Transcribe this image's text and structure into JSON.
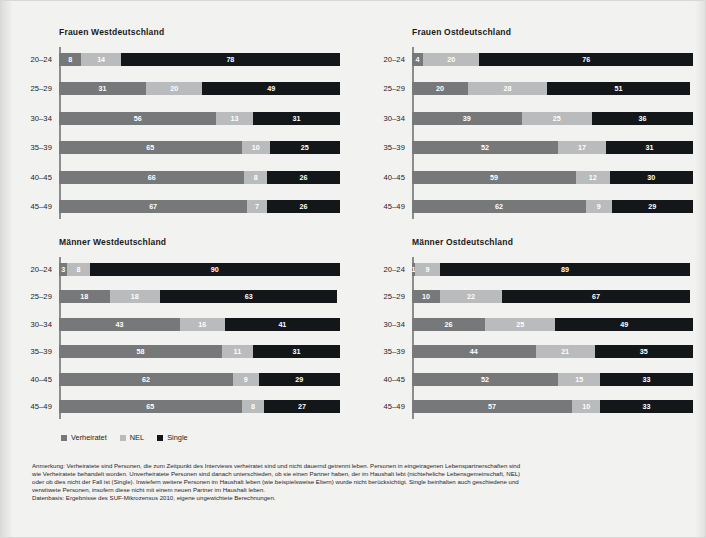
{
  "legend": {
    "items": [
      {
        "label": "Verheiratet",
        "key": "verheiratet",
        "color": "#76787a"
      },
      {
        "label": "NEL",
        "key": "nel",
        "color": "#b9bbbc"
      },
      {
        "label": "Single",
        "key": "single",
        "color": "#14171a"
      }
    ]
  },
  "notes": {
    "line1": "Anmerkung: Verheiratete sind Personen, die zum Zeitpunkt des Interviews verheiratet sind und nicht dauernd getrennt leben. Personen in eingetragenen Lebenspartnerschaften sind",
    "line2": "wie Verheiratete behandelt worden. Unverheiratete Personen sind danach unterschieden, ob sie einen Partner haben, der im Haushalt lebt (nichteheliche Lebensgemeinschaft, NEL)",
    "line3": "oder ob dies nicht der Fall ist (Single). Inwiefern weitere Personen im Haushalt leben (wie beispielsweise Eltern) wurde nicht berücksichtigt. Single beinhalten auch geschiedene und",
    "line4": "verwitwete Personen, insofern diese nicht mit einem neuen Partner im Haushalt leben.",
    "line5": "Datenbasis: Ergebnisse des SUF-Mikrozensus 2010, eigene ungewichtete Berechnungen."
  },
  "chart_data": [
    {
      "type": "bar",
      "orientation": "horizontal",
      "stacked": true,
      "title": "Frauen Westdeutschland",
      "xlabel": "",
      "ylabel": "",
      "xlim": [
        0,
        100
      ],
      "grid": false,
      "legend_position": "bottom",
      "categories": [
        "20–24",
        "25–29",
        "30–34",
        "35–39",
        "40–45",
        "45–49"
      ],
      "series": [
        {
          "name": "Verheiratet",
          "values": [
            8,
            31,
            56,
            65,
            66,
            67
          ]
        },
        {
          "name": "NEL",
          "values": [
            14,
            20,
            13,
            10,
            8,
            7
          ]
        },
        {
          "name": "Single",
          "values": [
            78,
            49,
            31,
            25,
            26,
            26
          ]
        }
      ]
    },
    {
      "type": "bar",
      "orientation": "horizontal",
      "stacked": true,
      "title": "Frauen Ostdeutschland",
      "xlabel": "",
      "ylabel": "",
      "xlim": [
        0,
        100
      ],
      "grid": false,
      "legend_position": "bottom",
      "categories": [
        "20–24",
        "25–29",
        "30–34",
        "35–39",
        "40–45",
        "45–49"
      ],
      "series": [
        {
          "name": "Verheiratet",
          "values": [
            4,
            20,
            39,
            52,
            59,
            62
          ]
        },
        {
          "name": "NEL",
          "values": [
            20,
            28,
            25,
            17,
            12,
            9
          ]
        },
        {
          "name": "Single",
          "values": [
            76,
            51,
            36,
            31,
            30,
            29
          ]
        }
      ]
    },
    {
      "type": "bar",
      "orientation": "horizontal",
      "stacked": true,
      "title": "Männer Westdeutschland",
      "xlabel": "",
      "ylabel": "",
      "xlim": [
        0,
        100
      ],
      "grid": false,
      "legend_position": "bottom",
      "categories": [
        "20–24",
        "25–29",
        "30–34",
        "35–39",
        "40–45",
        "45–49"
      ],
      "series": [
        {
          "name": "Verheiratet",
          "values": [
            3,
            18,
            43,
            58,
            62,
            65
          ]
        },
        {
          "name": "NEL",
          "values": [
            8,
            18,
            16,
            11,
            9,
            8
          ]
        },
        {
          "name": "Single",
          "values": [
            90,
            63,
            41,
            31,
            29,
            27
          ]
        }
      ]
    },
    {
      "type": "bar",
      "orientation": "horizontal",
      "stacked": true,
      "title": "Männer Ostdeutschland",
      "xlabel": "",
      "ylabel": "",
      "xlim": [
        0,
        100
      ],
      "grid": false,
      "legend_position": "bottom",
      "categories": [
        "20–24",
        "25–29",
        "30–34",
        "35–39",
        "40–45",
        "45–49"
      ],
      "series": [
        {
          "name": "Verheiratet",
          "values": [
            1,
            10,
            26,
            44,
            52,
            57
          ]
        },
        {
          "name": "NEL",
          "values": [
            9,
            22,
            25,
            21,
            15,
            10
          ]
        },
        {
          "name": "Single",
          "values": [
            89,
            67,
            49,
            35,
            33,
            33
          ]
        }
      ]
    }
  ]
}
